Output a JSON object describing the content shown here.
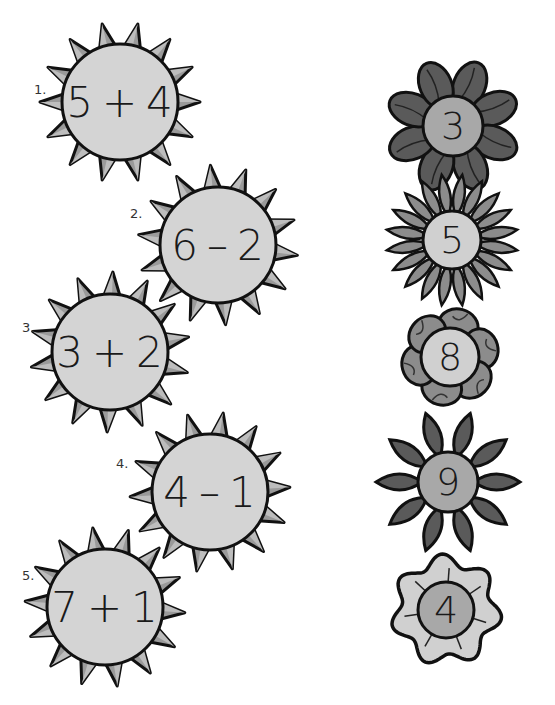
{
  "worksheet": {
    "suns": [
      {
        "label": "1.",
        "left": "5",
        "op": "+",
        "right": "4",
        "cx": 120,
        "cy": 102
      },
      {
        "label": "2.",
        "left": "6",
        "op": "–",
        "right": "2",
        "cx": 218,
        "cy": 245
      },
      {
        "label": "3.",
        "left": "3",
        "op": "+",
        "right": "2",
        "cx": 110,
        "cy": 352
      },
      {
        "label": "4.",
        "left": "4",
        "op": "–",
        "right": "1",
        "cx": 210,
        "cy": 492
      },
      {
        "label": "5.",
        "left": "7",
        "op": "+",
        "right": "1",
        "cx": 105,
        "cy": 607
      }
    ],
    "flowers": [
      {
        "number": "3",
        "style": "rounded-petals-dark",
        "cx": 453,
        "cy": 126
      },
      {
        "number": "5",
        "style": "many-pointed-petals",
        "cx": 452,
        "cy": 240
      },
      {
        "number": "8",
        "style": "round-lobed-petals",
        "cx": 450,
        "cy": 357
      },
      {
        "number": "9",
        "style": "pointed-petals-dark",
        "cx": 448,
        "cy": 482
      },
      {
        "number": "4",
        "style": "wavy-edge",
        "cx": 446,
        "cy": 610
      }
    ],
    "colors": {
      "sun_face": "#d4d4d4",
      "sun_ray": "#9a9a9a",
      "outline": "#111111",
      "flower_dark_petal": "#5a5a5a",
      "flower_mid_petal": "#8c8c8c",
      "flower_center_mid": "#a8a8a8",
      "flower_center_light": "#d0d0d0"
    }
  }
}
